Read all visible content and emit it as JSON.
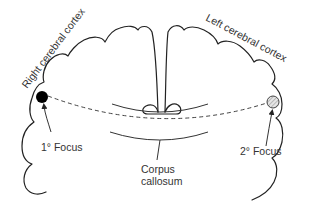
{
  "diagram": {
    "type": "brain coronal section — seizure propagation via corpus callosum",
    "labels": {
      "right_cortex": "Right cerebral cortex",
      "left_cortex": "Left cerebral cortex",
      "primary_focus": "1° Focus",
      "secondary_focus": "2° Focus",
      "corpus_callosum_line1": "Corpus",
      "corpus_callosum_line2": "callosum"
    },
    "colors": {
      "stroke": "#222222",
      "primary_focus_fill": "#000000",
      "secondary_focus_fill": "#dddddd",
      "text": "#333333"
    }
  }
}
